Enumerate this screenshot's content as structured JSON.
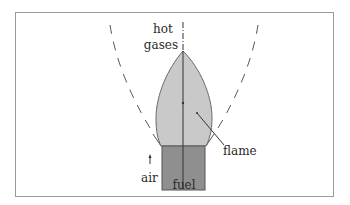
{
  "diagram": {
    "labels": {
      "hot": "hot",
      "gases": "gases",
      "flame": "flame",
      "air": "air",
      "fuel": "fuel"
    },
    "colors": {
      "border": "#9a9a9a",
      "flame_fill": "#c9c9c9",
      "flame_stroke": "#6a6a6a",
      "fuel_fill": "#8f8f8f",
      "fuel_stroke": "#555555",
      "axis_line": "#333333",
      "dashed_curve": "#555555",
      "text": "#2a2a2a"
    },
    "elements": [
      {
        "name": "flame",
        "shape": "ogive",
        "tip": [
          183,
          51
        ],
        "base_y": 146
      },
      {
        "name": "fuel-block",
        "shape": "rect",
        "x": 162,
        "y": 146,
        "w": 43,
        "h": 44
      },
      {
        "name": "center-axis",
        "shape": "line",
        "x": 183,
        "y1": 22,
        "y2": 190
      },
      {
        "name": "left-dashed-boundary",
        "shape": "dashed-curve"
      },
      {
        "name": "right-dashed-boundary",
        "shape": "dashed-curve"
      },
      {
        "name": "air-arrow",
        "shape": "arrow",
        "direction": "up"
      },
      {
        "name": "flame-leader-line",
        "shape": "line"
      }
    ]
  }
}
